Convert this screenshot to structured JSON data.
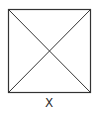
{
  "diagram": {
    "type": "square-with-diagonals",
    "label": "X",
    "stroke_color": "#333333",
    "background": "#ffffff",
    "square": {
      "x1": 8.5,
      "y1": 9.5,
      "x2": 90.5,
      "y2": 92.5
    }
  }
}
